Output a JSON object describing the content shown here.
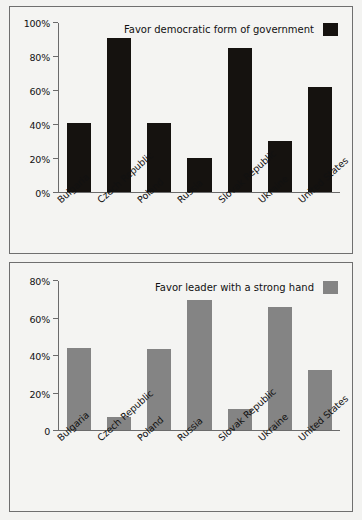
{
  "chart_data": [
    {
      "id": "democratic-chart",
      "type": "bar",
      "title": "",
      "legend_label": "Favor democratic form of government",
      "legend_position": "top-right",
      "series_color": "#15120f",
      "categories": [
        "Bulgaria",
        "Czech Republic",
        "Poland",
        "Russia",
        "Slovak Republic",
        "Ukraine",
        "United States"
      ],
      "values": [
        41,
        91,
        41,
        20,
        85,
        30,
        62
      ],
      "ylim": [
        0,
        100
      ],
      "yticks": [
        0,
        20,
        40,
        60,
        80,
        100
      ],
      "ytick_labels": [
        "0%",
        "20%",
        "40%",
        "60%",
        "80%",
        "100%"
      ],
      "xlabel": "",
      "ylabel": "",
      "grid": false
    },
    {
      "id": "strong-hand-chart",
      "type": "bar",
      "title": "",
      "legend_label": "Favor leader with a strong hand",
      "legend_position": "top-right",
      "series_color": "#848484",
      "categories": [
        "Bulgaria",
        "Czech Republic",
        "Poland",
        "Russia",
        "Slovak Republic",
        "Ukraine",
        "United States"
      ],
      "values": [
        44,
        7,
        43.5,
        70,
        11.5,
        66,
        32
      ],
      "ylim": [
        0,
        80
      ],
      "yticks": [
        0,
        20,
        40,
        60,
        80
      ],
      "ytick_labels": [
        "0",
        "20%",
        "40%",
        "60%",
        "80%"
      ],
      "xlabel": "",
      "ylabel": "",
      "grid": false
    }
  ]
}
